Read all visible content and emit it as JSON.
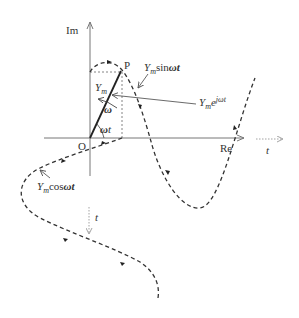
{
  "diagram": {
    "axes": {
      "imaginary_label": "Im",
      "real_label": "Re",
      "origin_label": "O"
    },
    "point_label": "P",
    "phasor": {
      "magnitude_label_base": "Y",
      "magnitude_label_sub": "m",
      "angular_velocity_label": "ω",
      "angle_label_base": "ω",
      "angle_label_var": "t"
    },
    "annotations": {
      "sine": {
        "base": "Y",
        "sub": "m",
        "func": "sin",
        "arg": "ωt"
      },
      "exponential": {
        "base": "Y",
        "sub": "m",
        "exp_base": "e",
        "exp": "jωt"
      },
      "cosine": {
        "base": "Y",
        "sub": "m",
        "func": "cos",
        "arg": "ωt"
      }
    },
    "time_axes": {
      "horizontal_t_label": "t",
      "vertical_t_label": "t"
    },
    "colors": {
      "axis": "#777777",
      "curve": "#333333",
      "phasor": "#222222",
      "text": "#333333"
    }
  }
}
